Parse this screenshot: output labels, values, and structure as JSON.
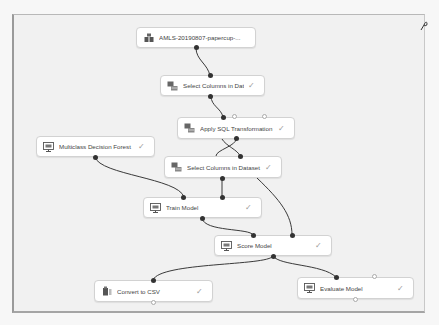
{
  "experiment": {
    "nodes": [
      {
        "id": "dataset",
        "label": "AMLS-20190807-papercup-...",
        "icon": "dataset-icon",
        "status": ""
      },
      {
        "id": "select1",
        "label": "Select Columns in Dataset",
        "icon": "module-icon",
        "status": "✓"
      },
      {
        "id": "sql",
        "label": "Apply SQL Transformation",
        "icon": "module-icon",
        "status": "✓"
      },
      {
        "id": "forest",
        "label": "Multiclass Decision Forest",
        "icon": "model-icon",
        "status": "✓"
      },
      {
        "id": "select2",
        "label": "Select Columns in Dataset",
        "icon": "module-icon",
        "status": "✓"
      },
      {
        "id": "train",
        "label": "Train Model",
        "icon": "model-icon",
        "status": "✓"
      },
      {
        "id": "score",
        "label": "Score Model",
        "icon": "model-icon",
        "status": "✓"
      },
      {
        "id": "csv",
        "label": "Convert to CSV",
        "icon": "convert-icon",
        "status": "✓"
      },
      {
        "id": "evaluate",
        "label": "Evaluate Model",
        "icon": "model-icon",
        "status": "✓"
      }
    ],
    "connections": [
      {
        "from": "dataset",
        "to": "select1"
      },
      {
        "from": "select1",
        "to": "sql"
      },
      {
        "from": "sql",
        "to": "select2"
      },
      {
        "from": "select2",
        "to": "train"
      },
      {
        "from": "forest",
        "to": "train"
      },
      {
        "from": "train",
        "to": "score"
      },
      {
        "from": "select2",
        "to": "score"
      },
      {
        "from": "score",
        "to": "csv"
      },
      {
        "from": "score",
        "to": "evaluate"
      }
    ]
  }
}
